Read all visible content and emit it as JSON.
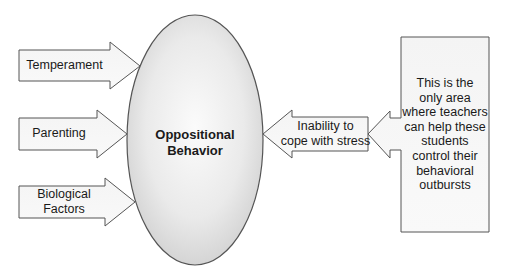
{
  "diagram": {
    "center": {
      "label_line1": "Oppositional",
      "label_line2": "Behavior"
    },
    "inputs": [
      {
        "label_line1": "Temperament",
        "label_line2": ""
      },
      {
        "label_line1": "Parenting",
        "label_line2": ""
      },
      {
        "label_line1": "Biological",
        "label_line2": "Factors"
      }
    ],
    "stress_arrow": {
      "label_line1": "Inability to",
      "label_line2": "cope with stress"
    },
    "callout": {
      "lines": [
        "This is the",
        "only area",
        "where teachers",
        "can help these",
        "students",
        "control their",
        "behavioral",
        "outbursts"
      ]
    },
    "colors": {
      "stroke": "#555555",
      "fill_light": "#f7f7f7",
      "ellipse_fill_center": "#fafafa",
      "ellipse_fill_edge": "#d2d2d2"
    }
  }
}
